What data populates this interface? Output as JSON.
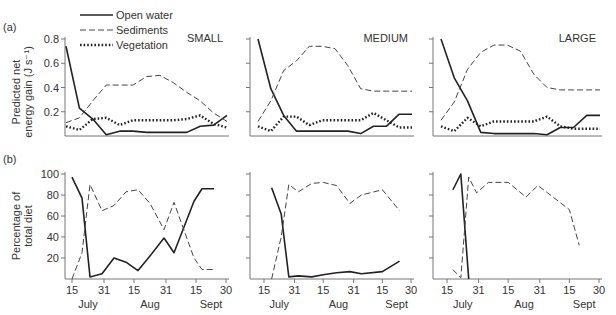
{
  "figure": {
    "panel_a_label": "(a)",
    "panel_b_label": "(b)",
    "ylabel_a_line1": "Predicted net",
    "ylabel_a_line2": "energy gain (J s⁻¹)",
    "ylabel_b_line1": "Percentage of",
    "ylabel_b_line2": "total diet",
    "legend": [
      {
        "name": "Open water",
        "style": "solid"
      },
      {
        "name": "Sediments",
        "style": "dashed"
      },
      {
        "name": "Vegetation",
        "style": "dotted"
      }
    ],
    "x_ticks": [
      "15",
      "31",
      "15",
      "31",
      "15",
      "30"
    ],
    "month_labels": [
      "July",
      "Aug",
      "Sept"
    ]
  },
  "chart_data": [
    {
      "type": "line",
      "panel": "(a)",
      "title": "SMALL",
      "ylabel": "Predicted net energy gain (J s⁻¹)",
      "yticks": [
        0.2,
        0.4,
        0.6,
        0.8
      ],
      "ylim": [
        0,
        0.8
      ],
      "x": [
        0,
        1,
        2,
        3,
        4,
        5,
        6,
        7,
        8,
        9,
        10,
        11,
        12
      ],
      "series": [
        {
          "name": "Open water",
          "values": [
            0.74,
            0.23,
            0.14,
            0.01,
            0.04,
            0.04,
            0.03,
            0.03,
            0.03,
            0.03,
            0.08,
            0.09,
            0.17
          ]
        },
        {
          "name": "Sediments",
          "values": [
            0.11,
            0.15,
            0.29,
            0.42,
            0.42,
            0.42,
            0.49,
            0.5,
            0.44,
            0.36,
            0.29,
            0.19,
            0.12
          ]
        },
        {
          "name": "Vegetation",
          "values": [
            0.08,
            0.05,
            0.14,
            0.15,
            0.09,
            0.13,
            0.13,
            0.13,
            0.13,
            0.14,
            0.17,
            0.1,
            0.07
          ]
        }
      ]
    },
    {
      "type": "line",
      "panel": "(a)",
      "title": "MEDIUM",
      "ylim": [
        0,
        0.8
      ],
      "x": [
        0,
        1,
        2,
        3,
        4,
        5,
        6,
        7,
        8,
        9,
        10,
        11,
        12
      ],
      "series": [
        {
          "name": "Open water",
          "values": [
            0.8,
            0.39,
            0.17,
            0.04,
            0.04,
            0.04,
            0.04,
            0.04,
            0.02,
            0.08,
            0.08,
            0.18,
            0.18
          ]
        },
        {
          "name": "Sediments",
          "values": [
            0.12,
            0.29,
            0.54,
            0.62,
            0.74,
            0.74,
            0.72,
            0.58,
            0.39,
            0.37,
            0.37,
            0.37,
            0.37
          ]
        },
        {
          "name": "Vegetation",
          "values": [
            0.08,
            0.04,
            0.16,
            0.16,
            0.09,
            0.13,
            0.13,
            0.13,
            0.13,
            0.19,
            0.13,
            0.07,
            0.07
          ]
        }
      ]
    },
    {
      "type": "line",
      "panel": "(a)",
      "title": "LARGE",
      "ylim": [
        0,
        0.8
      ],
      "x": [
        0,
        1,
        2,
        3,
        4,
        5,
        6,
        7,
        8,
        9,
        10,
        11,
        12
      ],
      "series": [
        {
          "name": "Open water",
          "values": [
            0.8,
            0.48,
            0.29,
            0.03,
            0.02,
            0.02,
            0.02,
            0.02,
            0.01,
            0.07,
            0.07,
            0.17,
            0.17
          ]
        },
        {
          "name": "Sediments",
          "values": [
            0.13,
            0.28,
            0.55,
            0.69,
            0.75,
            0.75,
            0.7,
            0.51,
            0.4,
            0.38,
            0.38,
            0.38,
            0.38
          ]
        },
        {
          "name": "Vegetation",
          "values": [
            0.08,
            0.04,
            0.15,
            0.08,
            0.12,
            0.12,
            0.12,
            0.12,
            0.16,
            0.08,
            0.06,
            0.06,
            0.06
          ]
        }
      ]
    },
    {
      "type": "line",
      "panel": "(b)",
      "title": "SMALL",
      "ylabel": "Percentage of total diet",
      "yticks": [
        20,
        40,
        60,
        80,
        100
      ],
      "ylim": [
        0,
        100
      ],
      "xticks": [
        "15 July",
        "31 July",
        "15 Aug",
        "31 Aug",
        "15 Sept",
        "30 Sept"
      ],
      "x": [
        15,
        20,
        24,
        30,
        36,
        42,
        48,
        54,
        61,
        66,
        76,
        80,
        86
      ],
      "series": [
        {
          "name": "Open water",
          "values": [
            97,
            77,
            2,
            5,
            20,
            16,
            8,
            22,
            39,
            25,
            74,
            86,
            86
          ]
        },
        {
          "name": "Sediments",
          "values": [
            0,
            25,
            90,
            65,
            70,
            83,
            85,
            72,
            47,
            73,
            20,
            9,
            9
          ]
        }
      ]
    },
    {
      "type": "line",
      "panel": "(b)",
      "title": "MEDIUM",
      "ylim": [
        0,
        100
      ],
      "xticks": [
        "15 July",
        "31 July",
        "15 Aug",
        "31 Aug",
        "15 Sept",
        "30 Sept"
      ],
      "x": [
        19,
        24,
        28,
        33,
        40,
        46,
        53,
        60,
        66,
        77,
        86
      ],
      "series": [
        {
          "name": "Open water",
          "values": [
            87,
            62,
            2,
            3,
            2,
            4,
            6,
            7,
            5,
            7,
            17
          ]
        },
        {
          "name": "Sediments",
          "values": [
            0,
            40,
            90,
            83,
            91,
            92,
            89,
            72,
            80,
            85,
            65
          ]
        }
      ]
    },
    {
      "type": "line",
      "panel": "(b)",
      "title": "LARGE",
      "ylim": [
        0,
        100
      ],
      "xticks": [
        "15 July",
        "31 July",
        "15 Aug",
        "31 Aug",
        "15 Sept",
        "30 Sept"
      ],
      "x": [
        18,
        22,
        26,
        30,
        36,
        46,
        55,
        61,
        66,
        77,
        82
      ],
      "series": [
        {
          "name": "Open water",
          "values": [
            85,
            100,
            0,
            null,
            null,
            null,
            null,
            null,
            null,
            null,
            null
          ]
        },
        {
          "name": "Sediments",
          "values": [
            9,
            1,
            97,
            82,
            92,
            92,
            78,
            89,
            82,
            66,
            32
          ]
        }
      ]
    }
  ]
}
